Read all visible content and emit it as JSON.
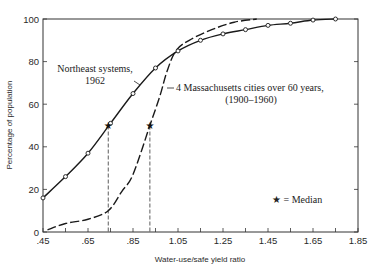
{
  "chart_data": {
    "type": "line",
    "title": "",
    "xlabel": "Water-use/safe yield ratio",
    "ylabel": "Percentage of population",
    "xlim": [
      0.45,
      1.85
    ],
    "ylim": [
      0,
      100
    ],
    "x_ticks": [
      0.45,
      0.55,
      0.65,
      0.75,
      0.85,
      0.95,
      1.05,
      1.15,
      1.25,
      1.35,
      1.45,
      1.55,
      1.65,
      1.75,
      1.85
    ],
    "x_tick_labels": [
      ".45",
      ".65",
      ".85",
      "1.05",
      "1.25",
      "1.45",
      "1.65",
      "1.85"
    ],
    "x_tick_label_values": [
      0.45,
      0.65,
      0.85,
      1.05,
      1.25,
      1.45,
      1.65,
      1.85
    ],
    "y_ticks": [
      0,
      20,
      40,
      60,
      80,
      100
    ],
    "y_tick_labels": [
      "0",
      "20",
      "40",
      "60",
      "80",
      "100"
    ],
    "grid": false,
    "series": [
      {
        "name": "Northeast systems, 1962",
        "style": "solid",
        "marker": "circle",
        "x": [
          0.45,
          0.55,
          0.65,
          0.75,
          0.85,
          0.95,
          1.05,
          1.15,
          1.25,
          1.35,
          1.45,
          1.55,
          1.65,
          1.75
        ],
        "y": [
          16,
          26,
          37,
          51,
          65,
          77,
          85,
          90,
          93,
          95,
          97,
          98,
          99.5,
          100
        ]
      },
      {
        "name": "4 Massachusetts cities over 60 years, (1900–1960)",
        "style": "dashed",
        "marker": "none",
        "x": [
          0.47,
          0.55,
          0.65,
          0.74,
          0.8,
          0.85,
          0.925,
          0.97,
          1.0,
          1.04,
          1.1,
          1.2,
          1.3,
          1.4
        ],
        "y": [
          1,
          4,
          6,
          10,
          19,
          27,
          50,
          64,
          75,
          85,
          90,
          95,
          98.5,
          100
        ]
      }
    ],
    "medians": [
      {
        "series": "Northeast systems, 1962",
        "x": 0.74,
        "y": 50
      },
      {
        "series": "4 Massachusetts cities over 60 years, (1900–1960)",
        "x": 0.925,
        "y": 50
      }
    ],
    "annotations": [
      {
        "text": "Northeast systems,",
        "line2": "1962"
      },
      {
        "text": "4 Massachusetts cities over 60 years,",
        "line2": "(1900–1960)"
      },
      {
        "text": "★ = Median"
      }
    ],
    "legend": {
      "position": "lower right",
      "entries": [
        "★ = Median"
      ]
    }
  },
  "labels": {
    "xlabel": "Water-use/safe yield ratio",
    "ylabel": "Percentage of population",
    "annot_ne_1": "Northeast systems,",
    "annot_ne_2": "1962",
    "annot_ma_1": "4 Massachusetts cities over 60 years,",
    "annot_ma_2": "(1900–1960)",
    "median_legend": "★ = Median"
  }
}
